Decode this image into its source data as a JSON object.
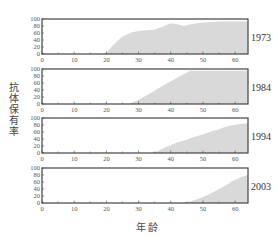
{
  "chart_data": {
    "type": "area",
    "xlabel": "年龄",
    "ylabel": "抗体保有率",
    "xlim": [
      0,
      64
    ],
    "ylim": [
      0,
      100
    ],
    "x_ticks": [
      0,
      10,
      20,
      30,
      40,
      50,
      60
    ],
    "y_ticks": [
      0,
      20,
      40,
      60,
      80,
      100
    ],
    "fill_color": "#d9d9d9",
    "frame_color": "#444444",
    "panels": [
      {
        "label": "1973",
        "points": [
          [
            0,
            0
          ],
          [
            19,
            0
          ],
          [
            20,
            3
          ],
          [
            22,
            25
          ],
          [
            25,
            50
          ],
          [
            28,
            62
          ],
          [
            30,
            66
          ],
          [
            33,
            68
          ],
          [
            35,
            70
          ],
          [
            38,
            80
          ],
          [
            40,
            88
          ],
          [
            42,
            85
          ],
          [
            44,
            80
          ],
          [
            46,
            84
          ],
          [
            48,
            88
          ],
          [
            52,
            91
          ],
          [
            56,
            93
          ],
          [
            60,
            93
          ],
          [
            64,
            93
          ]
        ]
      },
      {
        "label": "1984",
        "points": [
          [
            0,
            0
          ],
          [
            27,
            0
          ],
          [
            30,
            12
          ],
          [
            34,
            32
          ],
          [
            38,
            55
          ],
          [
            42,
            75
          ],
          [
            46,
            95
          ],
          [
            50,
            95
          ],
          [
            55,
            95
          ],
          [
            60,
            95
          ],
          [
            64,
            95
          ]
        ]
      },
      {
        "label": "1994",
        "points": [
          [
            0,
            0
          ],
          [
            34,
            0
          ],
          [
            36,
            6
          ],
          [
            38,
            15
          ],
          [
            40,
            22
          ],
          [
            42,
            30
          ],
          [
            45,
            38
          ],
          [
            47,
            45
          ],
          [
            50,
            53
          ],
          [
            52,
            60
          ],
          [
            55,
            68
          ],
          [
            57,
            75
          ],
          [
            59,
            79
          ],
          [
            61,
            82
          ],
          [
            64,
            85
          ]
        ]
      },
      {
        "label": "2003",
        "points": [
          [
            0,
            0
          ],
          [
            43,
            0
          ],
          [
            46,
            4
          ],
          [
            48,
            10
          ],
          [
            50,
            17
          ],
          [
            52,
            25
          ],
          [
            54,
            35
          ],
          [
            56,
            45
          ],
          [
            58,
            55
          ],
          [
            59,
            62
          ],
          [
            61,
            70
          ],
          [
            62,
            75
          ],
          [
            64,
            80
          ]
        ]
      }
    ]
  },
  "labels": {
    "ylabel": "抗体保有率",
    "xlabel": "年龄"
  }
}
